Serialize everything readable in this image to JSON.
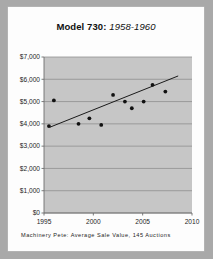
{
  "card": {
    "background_color": "#fdfdfd",
    "outer_background_color": "#a9a9a9"
  },
  "title": {
    "model": "Model 730:",
    "years": "1958-1960",
    "full": "Model 730: 1958-1960"
  },
  "footnote": {
    "text": "Machinery Pete: Average Sale Value, 145 Auctions"
  },
  "chart_data": {
    "type": "scatter",
    "title": "Model 730: 1958-1960",
    "xlabel": "",
    "ylabel": "",
    "xlim": [
      1995,
      2010
    ],
    "ylim": [
      0,
      7000
    ],
    "grid": true,
    "legend": false,
    "plot_background_color": "#c6c6c6",
    "gridline_color": "#8f8f8f",
    "axis_color": "#6d6d6d",
    "point_color": "#111111",
    "trendline_color": "#1a1a1a",
    "xticks": [
      1995,
      2000,
      2005,
      2010
    ],
    "xtick_labels": [
      "1995",
      "2000",
      "2005",
      "2010"
    ],
    "yticks": [
      0,
      1000,
      2000,
      3000,
      4000,
      5000,
      6000,
      7000
    ],
    "ytick_labels": [
      "$0",
      "$1,000",
      "$2,000",
      "$3,000",
      "$4,000",
      "$5,000",
      "$6,000",
      "$7,000"
    ],
    "series": [
      {
        "name": "Average Sale Value",
        "marker": "circle",
        "points": [
          {
            "x": 1995.5,
            "y": 3900
          },
          {
            "x": 1996.0,
            "y": 5050
          },
          {
            "x": 1998.5,
            "y": 4000
          },
          {
            "x": 1999.6,
            "y": 4250
          },
          {
            "x": 2000.8,
            "y": 3950
          },
          {
            "x": 2002.0,
            "y": 5300
          },
          {
            "x": 2003.2,
            "y": 5000
          },
          {
            "x": 2003.9,
            "y": 4700
          },
          {
            "x": 2005.1,
            "y": 5000
          },
          {
            "x": 2006.0,
            "y": 5750
          },
          {
            "x": 2007.3,
            "y": 5450
          }
        ]
      }
    ],
    "trendline": {
      "name": "linear-fit",
      "x0": 1995.6,
      "y0": 3850,
      "x1": 2008.6,
      "y1": 6150
    }
  }
}
